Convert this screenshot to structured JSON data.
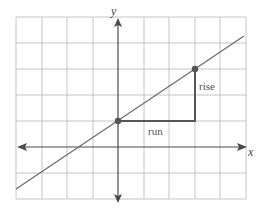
{
  "diagram": {
    "title": "",
    "axes": {
      "x_label": "x",
      "y_label": "y"
    },
    "grid": {
      "columns": 9,
      "rows": 7,
      "x_range": [
        -4,
        5
      ],
      "y_range": [
        -2,
        5
      ]
    },
    "points": [
      {
        "name": "point-a",
        "x": 0,
        "y": 1
      },
      {
        "name": "point-b",
        "x": 3,
        "y": 3
      }
    ],
    "line": {
      "slope": 0.667,
      "intercept": 1
    },
    "labels": {
      "run": "run",
      "rise": "rise"
    },
    "colors": {
      "grid": "#c4c4c4",
      "axis": "#4a4a4a",
      "line": "#6a6a6a",
      "triangle": "#555555"
    }
  }
}
